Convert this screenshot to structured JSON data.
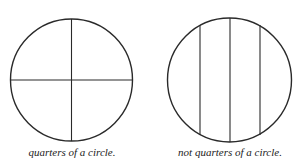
{
  "figures": [
    {
      "id": "quarters",
      "caption": "quarters of a circle.",
      "circle": {
        "cx": 71.5,
        "cy": 80,
        "r": 61
      },
      "lines": [
        {
          "x1": 71.5,
          "y1": 19,
          "x2": 71.5,
          "y2": 141
        },
        {
          "x1": 10.5,
          "y1": 80,
          "x2": 132.5,
          "y2": 80
        }
      ]
    },
    {
      "id": "not-quarters",
      "caption": "not quarters of a circle.",
      "circle": {
        "cx": 229.5,
        "cy": 80,
        "r": 62
      },
      "lines": [
        {
          "x1": 200,
          "y1": 25,
          "x2": 200,
          "y2": 135
        },
        {
          "x1": 230,
          "y1": 18,
          "x2": 230,
          "y2": 142
        },
        {
          "x1": 260,
          "y1": 25,
          "x2": 260,
          "y2": 135
        }
      ]
    }
  ],
  "colors": {
    "stroke": "#2a2a2a",
    "background": "#ffffff"
  }
}
